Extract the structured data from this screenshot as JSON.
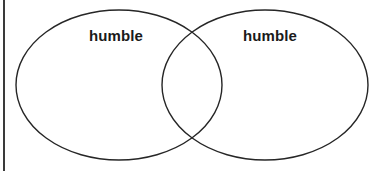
{
  "diagram": {
    "type": "venn",
    "title": "",
    "background_color": "#ffffff",
    "stroke_color": "#262626",
    "text_color": "#1a1a1a",
    "sets": [
      {
        "id": "left-set",
        "label": "humble",
        "position": "left",
        "shape": "ellipse",
        "center_x": 119,
        "center_y": 85,
        "radius_x": 103,
        "radius_y": 75
      },
      {
        "id": "right-set",
        "label": "humble",
        "position": "right",
        "shape": "ellipse",
        "center_x": 265,
        "center_y": 85,
        "radius_x": 103,
        "radius_y": 75
      }
    ],
    "intersection": {
      "label": "",
      "center_x": 192,
      "center_y": 85
    },
    "rule": {
      "name": "left-margin-rule",
      "color": "#3a3a3a",
      "orientation": "vertical"
    }
  }
}
